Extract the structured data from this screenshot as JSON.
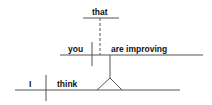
{
  "diagram": {
    "type": "sentence-diagram",
    "words": {
      "conjunction": "that",
      "clause_subject": "you",
      "clause_predicate": "are improving",
      "main_subject": "I",
      "main_verb": "think"
    },
    "colors": {
      "line": "#555555",
      "text": "#111111",
      "background": "#ffffff"
    }
  }
}
